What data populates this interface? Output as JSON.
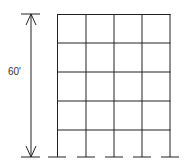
{
  "diagram": {
    "type": "building-frame",
    "stories": 5,
    "bays": 4,
    "dimension_label": "60'",
    "colors": {
      "line": "#222222",
      "background": "#ffffff"
    }
  }
}
